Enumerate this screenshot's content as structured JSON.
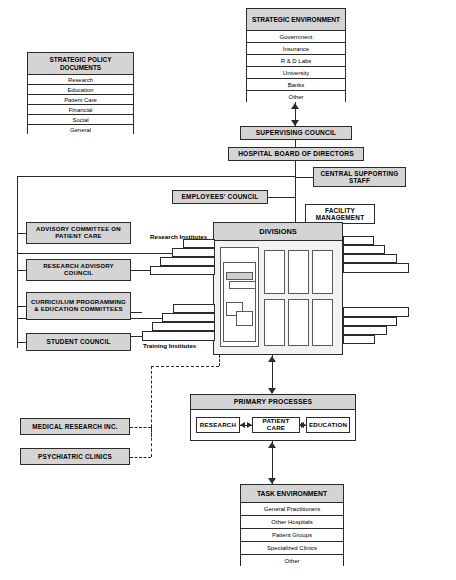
{
  "strategic_environment": {
    "header": "STRATEGIC ENVIRONMENT",
    "rows": [
      "Government",
      "Insurance",
      "R & D Labs",
      "University",
      "Banks",
      "Other"
    ]
  },
  "strategic_policy": {
    "header": "STRATEGIC POLICY DOCUMENTS",
    "rows": [
      "Research",
      "Education",
      "Patient Care",
      "Financial",
      "Social",
      "General"
    ]
  },
  "task_environment": {
    "header": "TASK ENVIRONMENT",
    "rows": [
      "General Practitioners",
      "Other Hospitals",
      "Patient Groups",
      "Specialized Clinics",
      "Other"
    ]
  },
  "nodes": {
    "supervising_council": "SUPERVISING COUNCIL",
    "hospital_board": "HOSPITAL BOARD OF DIRECTORS",
    "central_supporting_staff": "CENTRAL SUPPORTING STAFF",
    "employees_council": "EMPLOYEES' COUNCIL",
    "facility_management": "FACILITY MANAGEMENT",
    "divisions": "DIVISIONS",
    "advisory_committee": "ADVISORY COMMITTEE ON PATIENT CARE",
    "research_advisory": "RESEARCH ADVISORY COUNCIL",
    "curriculum": "CURRICULUM PROGRAMMING & EDUCATION COMMITTEES",
    "student_council": "STUDENT COUNCIL",
    "medical_research": "MEDICAL RESEARCH INC.",
    "psychiatric_clinics": "PSYCHIATRIC CLINICS"
  },
  "captions": {
    "research_institutes": "Research Institutes",
    "training_institutes": "Training Institutes"
  },
  "primary_processes": {
    "header": "PRIMARY PROCESSES",
    "items": [
      "RESEARCH",
      "PATIENT CARE",
      "EDUCATION"
    ]
  },
  "colors": {
    "box_fill": "#d4d4d4",
    "block_fill": "#f2f2f2",
    "stroke": "#2b2b2b",
    "white": "#ffffff"
  }
}
